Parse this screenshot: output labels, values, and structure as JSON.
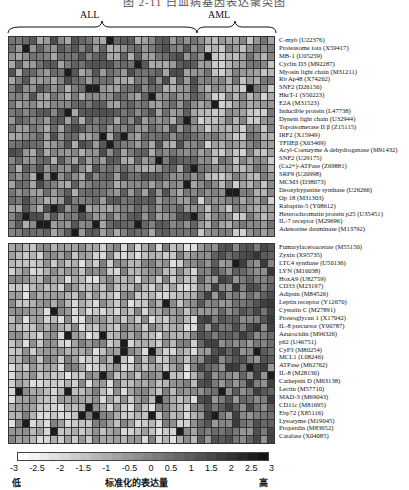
{
  "title": "图 2-11  白血病基因表达聚类图",
  "groups": [
    {
      "label": "ALL",
      "x": 90
    },
    {
      "label": "AML",
      "x": 218
    }
  ],
  "chart_data": {
    "type": "heatmap",
    "title": "",
    "columns": 38,
    "column_groups": [
      {
        "name": "ALL",
        "count": 27
      },
      {
        "name": "AML",
        "count": 11
      }
    ],
    "top_genes": [
      "C-myb (U22376)",
      "Proteasome iota (X59417)",
      "MB-1 (U05259)",
      "Cyclin D3 (M92287)",
      "Myosin light chain (M31211)",
      "Rb Ap48 (X74262)",
      "SNF2 (D26156)",
      "HkrT-1 (S50223)",
      "E2A (M31523)",
      "Inducible protein (L47738)",
      "Dynein light chain (U32944)",
      "Topoisomerase II β (Z15115)",
      "IRF2 (X15949)",
      "TFIIEβ (X63469)",
      "Acyl-Coenzyme A dehydrogenase (M91432)",
      "SNF2 (U29175)",
      "(Ca2+)-ATPase (Z69881)",
      "SRP9 (U20998)",
      "MCM3 (D38073)",
      "Deoxyhypusine synthase (U26266)",
      "Op 18 (M31303)",
      "Rabaptin-5 (Y08612)",
      "Heterochromatin protein p25 (U35451)",
      "IL-7 receptor (M29696)",
      "Adenosine deaminase (M13792)"
    ],
    "bottom_genes": [
      "Fumarylacetoacetate (M55150)",
      "Zyxin (X95735)",
      "LTC4 synthase (U50136)",
      "LYN (M16038)",
      "HoxA9 (U82759)",
      "CD33 (M23197)",
      "Adipsin (M84526)",
      "Leptin receptor (Y12670)",
      "Cystatin C (M27891)",
      "Proteoglycan 1 (X17042)",
      "IL-8 precursor (Y00787)",
      "Azurocidin (M96326)",
      "p62 (U46751)",
      "CyP3 (M80254)",
      "MCL1 (L08246)",
      "ATPase (M62762)",
      "IL-8 (M28130)",
      "Cathepsin D (M63138)",
      "Lectin (M57710)",
      "MAD-3 (M69043)",
      "CD11c (M81695)",
      "Ebp72 (X85116)",
      "Lysozyme (M19045)",
      "Properdin (M83652)",
      "Catalase (X04085)"
    ],
    "colorbar": {
      "min": -3,
      "max": 3,
      "ticks": [
        "-3",
        "-2.5",
        "-2",
        "-1.5",
        "-1",
        "-0.5",
        "0",
        "0.5",
        "1",
        "1.5",
        "2",
        "2.5",
        "3"
      ],
      "low_label": "低",
      "high_label": "高",
      "label": "标准化的表达量"
    },
    "top_pattern": "ALL high, AML low",
    "bottom_pattern": "ALL low, AML high"
  }
}
